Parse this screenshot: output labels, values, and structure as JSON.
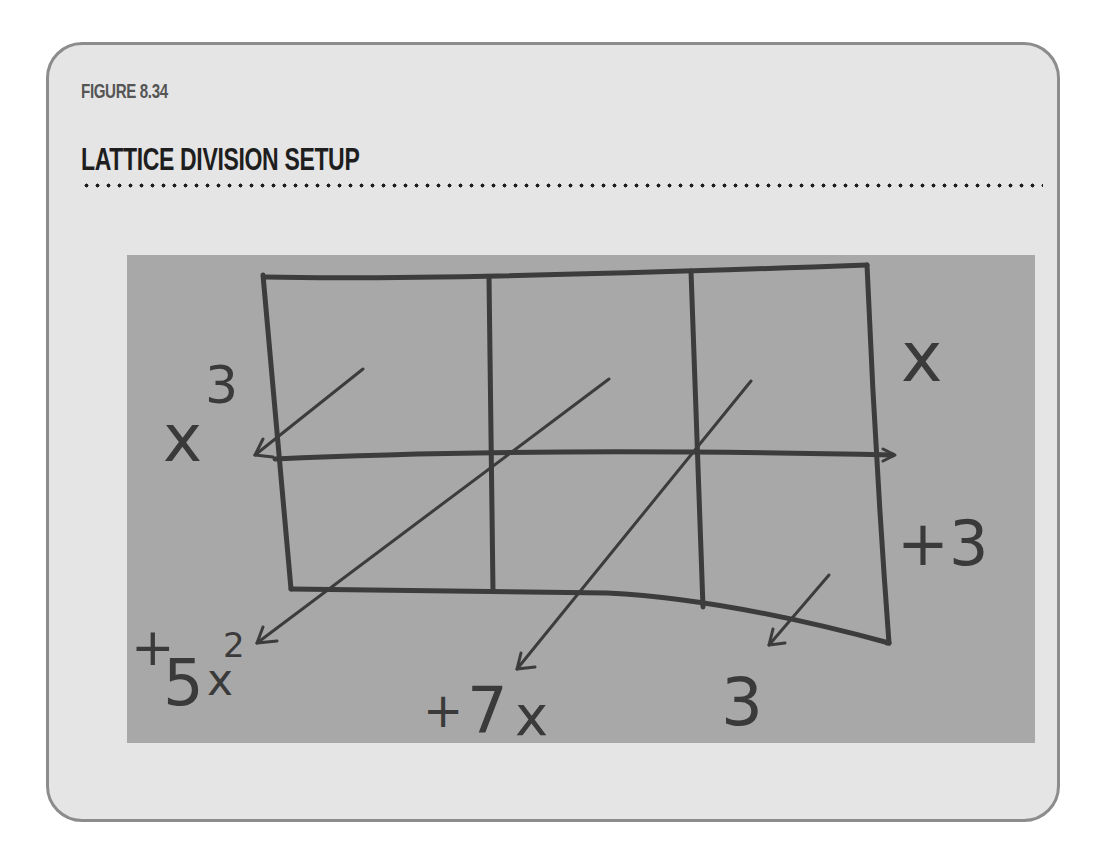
{
  "figure": {
    "label": "FIGURE 8.34",
    "title": "LATTICE DIVISION SETUP"
  },
  "diagram": {
    "divisor_terms_right": [
      "x",
      "+3"
    ],
    "top_left_term": "x",
    "top_left_exponent": "3",
    "bottom_terms": [
      {
        "sign": "+",
        "coef": "5",
        "var": "x",
        "exp": "2"
      },
      {
        "sign": "+",
        "coef": "7",
        "var": "x",
        "exp": ""
      },
      {
        "sign": "",
        "coef": "3",
        "var": "",
        "exp": ""
      }
    ],
    "colors": {
      "card_background": "#e5e5e5",
      "card_border": "#8c8c8c",
      "photo_background": "#a8a8a8",
      "ink": "#3a3a3a"
    }
  }
}
